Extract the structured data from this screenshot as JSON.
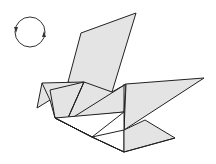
{
  "diagram": {
    "symbol": "rotate-model-icon",
    "colors": {
      "paper_fill": "#e4e4e4",
      "paper_back": "#ffffff",
      "line": "#222222",
      "background": "#ffffff"
    }
  }
}
